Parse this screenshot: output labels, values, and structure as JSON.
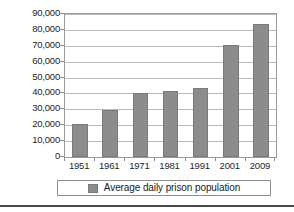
{
  "chart_data": {
    "type": "bar",
    "title": "",
    "subtitle": "",
    "xlabel": "",
    "ylabel": "",
    "categories": [
      "1951",
      "1961",
      "1971",
      "1981",
      "1991",
      "2001",
      "2009"
    ],
    "values": [
      21000,
      29500,
      40000,
      41500,
      43500,
      70500,
      83500
    ],
    "series": [
      {
        "name": "Average daily prison population",
        "values": [
          21000,
          29500,
          40000,
          41500,
          43500,
          70500,
          83500
        ],
        "color": "#8c8c8c"
      }
    ],
    "ylim": [
      0,
      90000
    ],
    "ytick_values": [
      0,
      10000,
      20000,
      30000,
      40000,
      50000,
      60000,
      70000,
      80000,
      90000
    ],
    "ytick_labels": [
      "0",
      "10,000",
      "20,000",
      "30,000",
      "40,000",
      "50,000",
      "60,000",
      "70,000",
      "80,000",
      "90,000"
    ],
    "grid": true,
    "grid_axis": "y",
    "legend_position": "bottom",
    "bar_color": "#8c8c8c",
    "gridline_color": "#b9b9b9",
    "frame_color": "#9a9a9a"
  },
  "legend": {
    "entries": [
      {
        "label": "Average daily prison population",
        "color": "#8c8c8c"
      }
    ]
  }
}
